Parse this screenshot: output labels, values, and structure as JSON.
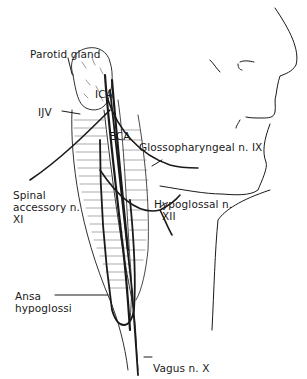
{
  "figure": {
    "colors": {
      "line": "#1a1a1a",
      "background": "#ffffff",
      "hatch": "#555555"
    }
  },
  "labels": {
    "parotid_gland": "Parotid gland",
    "ica": "ICA",
    "ijv": "IJV",
    "eca": "ECA",
    "glossopharyngeal": "Glossopharyngeal n. IX",
    "spinal_accessory_line1": "Spinal",
    "spinal_accessory_line2": "accessory n.",
    "spinal_accessory_line3": "XI",
    "hypoglossal_line1": "Hypoglossal n.",
    "hypoglossal_line2": "XII",
    "ansa_line1": "Ansa",
    "ansa_line2": "hypoglossi",
    "vagus": "Vagus n. X"
  }
}
